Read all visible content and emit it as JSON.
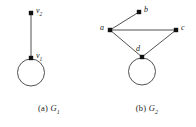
{
  "figure": {
    "background_color": "#ffffff",
    "ink_color": "#1c1c1c",
    "edge_color": "#3d3d3d",
    "panels": [
      {
        "id": "G1",
        "caption_tag": "(a)",
        "caption_name": "G",
        "caption_sub": "1",
        "vertices": [
          {
            "id": "v2",
            "name": "v",
            "sub": "2",
            "x": 31,
            "y": 13,
            "label_x": 36,
            "label_y": 8
          },
          {
            "id": "v1",
            "name": "v",
            "sub": "1",
            "x": 31,
            "y": 58,
            "label_x": 36,
            "label_y": 53
          }
        ],
        "edges": [
          {
            "from": "v2",
            "to": "v1"
          }
        ],
        "loops": [
          {
            "at": "v1",
            "cx": 31,
            "cy": 72.5,
            "r": 13.5
          }
        ]
      },
      {
        "id": "G2",
        "caption_tag": "(b)",
        "caption_name": "G",
        "caption_sub": "2",
        "vertices": [
          {
            "id": "a",
            "name": "a",
            "sub": "",
            "x": 12,
            "y": 30,
            "label_x": 2,
            "label_y": 25
          },
          {
            "id": "b",
            "name": "b",
            "sub": "",
            "x": 41,
            "y": 12,
            "label_x": 46,
            "label_y": 7
          },
          {
            "id": "c",
            "name": "c",
            "sub": "",
            "x": 78,
            "y": 30,
            "label_x": 83,
            "label_y": 25
          },
          {
            "id": "d",
            "name": "d",
            "sub": "",
            "x": 44,
            "y": 57,
            "label_x": 38,
            "label_y": 46
          }
        ],
        "edges": [
          {
            "from": "a",
            "to": "b"
          },
          {
            "from": "a",
            "to": "c"
          },
          {
            "from": "a",
            "to": "d"
          },
          {
            "from": "c",
            "to": "d"
          }
        ],
        "loops": [
          {
            "at": "d",
            "cx": 44,
            "cy": 71.5,
            "r": 13.5
          }
        ]
      }
    ]
  }
}
